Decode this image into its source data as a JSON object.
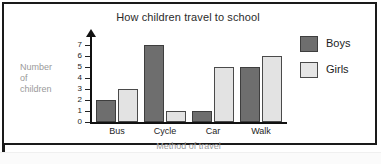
{
  "chart_data": {
    "type": "bar",
    "title": "How children travel to school",
    "xlabel": "Method of travel",
    "ylabel": "Number of children",
    "ylabel_lines": [
      "Number",
      "of",
      "children"
    ],
    "categories": [
      "Bus",
      "Cycle",
      "Car",
      "Walk"
    ],
    "series": [
      {
        "name": "Boys",
        "values": [
          2,
          7,
          1,
          5
        ],
        "color": "#6e6e6e"
      },
      {
        "name": "Girls",
        "values": [
          3,
          1,
          5,
          6
        ],
        "color": "#e3e3e3"
      }
    ],
    "ylim": [
      0,
      7
    ],
    "yticks": [
      7,
      6,
      5,
      4,
      3,
      2,
      1,
      0
    ],
    "grid": false,
    "legend_position": "right",
    "axis_arrow": "up"
  },
  "legend": {
    "items": [
      {
        "label": "Boys",
        "swatch": "boys-swatch"
      },
      {
        "label": "Girls",
        "swatch": "girls-swatch"
      }
    ]
  }
}
